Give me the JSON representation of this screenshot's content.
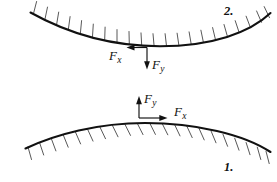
{
  "figure": {
    "background_color": "#ffffff",
    "line_color": "#111111",
    "hatch_color": "#3a3a3a",
    "width": 277,
    "height": 182
  },
  "diagrams": [
    {
      "id": "upper",
      "index_label": "2.",
      "surface": "concave-up-hatched-above",
      "forces": [
        {
          "name": "Fx",
          "symbol": "F",
          "subscript": "x",
          "direction": "left"
        },
        {
          "name": "Fy",
          "symbol": "F",
          "subscript": "y",
          "direction": "down"
        }
      ]
    },
    {
      "id": "lower",
      "index_label": "1.",
      "surface": "convex-up-hatched-below",
      "forces": [
        {
          "name": "Fy",
          "symbol": "F",
          "subscript": "y",
          "direction": "up"
        },
        {
          "name": "Fx",
          "symbol": "F",
          "subscript": "x",
          "direction": "right"
        }
      ]
    }
  ]
}
